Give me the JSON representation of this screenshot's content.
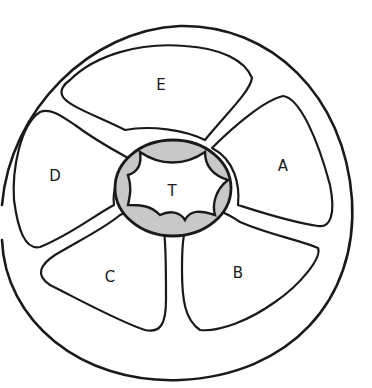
{
  "diagram": {
    "type": "wheel-sectors-sketch",
    "hub": {
      "label": "T"
    },
    "sectors": [
      {
        "id": "A",
        "label": "A"
      },
      {
        "id": "B",
        "label": "B"
      },
      {
        "id": "C",
        "label": "C"
      },
      {
        "id": "D",
        "label": "D"
      },
      {
        "id": "E",
        "label": "E"
      }
    ],
    "colors": {
      "ink": "#1a1a1a",
      "hub_shade": "#9a9a9a",
      "background": "#ffffff"
    }
  }
}
